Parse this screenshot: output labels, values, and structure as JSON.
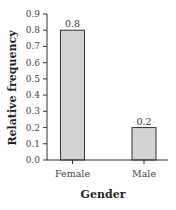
{
  "chart_data": {
    "type": "bar",
    "title": "",
    "categories": [
      "Female",
      "Male"
    ],
    "values": [
      0.8,
      0.2
    ],
    "data_labels": [
      "0.8",
      "0.2"
    ],
    "xlabel": "Gender",
    "ylabel": "Relative frequency",
    "ylim": [
      0.0,
      0.9
    ],
    "yticks": [
      "0.0",
      "0.1",
      "0.2",
      "0.3",
      "0.4",
      "0.5",
      "0.6",
      "0.7",
      "0.8",
      "0.9"
    ],
    "grid": false,
    "legend": null,
    "colors": {
      "bar_fill": "#d3d3d3",
      "bar_stroke": "#333333",
      "axis": "#333333"
    }
  }
}
